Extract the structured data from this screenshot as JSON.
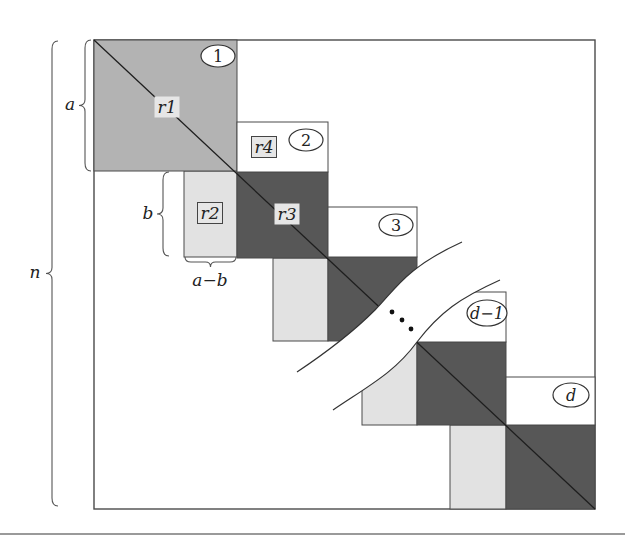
{
  "figure": {
    "colors": {
      "background": "#ffffff",
      "outline": "#4a4a4a",
      "block1_fill": "#b3b3b3",
      "dark_fill": "#575757",
      "light_fill": "#e2e2e2",
      "label_box_fill": "#e6e6e6",
      "diagonal": "#1e1e1e"
    },
    "outer_box": {
      "x": 94,
      "y": 40,
      "w": 501,
      "h": 469
    },
    "blocks": [
      {
        "id": "1",
        "label": "1",
        "white": null,
        "shade": {
          "x": 94,
          "y": 40,
          "w": 143,
          "h": 131,
          "kind": "block1"
        },
        "ellipse": {
          "cx": 218,
          "cy": 56,
          "rx": 17,
          "ry": 11
        }
      },
      {
        "id": "2",
        "label": "2",
        "white": {
          "x": 237,
          "y": 122,
          "w": 91,
          "h": 50
        },
        "shade": {
          "x": 237,
          "y": 172,
          "w": 91,
          "h": 86,
          "kind": "dark"
        },
        "ellipse": {
          "cx": 306,
          "cy": 140,
          "rx": 17,
          "ry": 11
        }
      },
      {
        "id": "3",
        "label": "3",
        "white": {
          "x": 328,
          "y": 207,
          "w": 89,
          "h": 50
        },
        "shade": {
          "x": 328,
          "y": 257,
          "w": 89,
          "h": 84,
          "kind": "dark"
        },
        "ellipse": {
          "cx": 396,
          "cy": 225,
          "rx": 17,
          "ry": 11
        }
      },
      {
        "id": "d-1",
        "label": "d−1",
        "white": {
          "x": 417,
          "y": 292,
          "w": 89,
          "h": 50
        },
        "shade": {
          "x": 417,
          "y": 342,
          "w": 89,
          "h": 83,
          "kind": "dark"
        },
        "ellipse": {
          "cx": 487,
          "cy": 313,
          "rx": 20,
          "ry": 13
        }
      },
      {
        "id": "d",
        "label": "d",
        "white": {
          "x": 506,
          "y": 377,
          "w": 89,
          "h": 48
        },
        "shade": {
          "x": 506,
          "y": 425,
          "w": 89,
          "h": 84,
          "kind": "dark"
        },
        "ellipse": {
          "cx": 571,
          "cy": 395,
          "rx": 18,
          "ry": 12
        }
      }
    ],
    "light_blocks": [
      {
        "x": 184,
        "y": 171,
        "w": 53,
        "h": 86
      },
      {
        "x": 273,
        "y": 258,
        "w": 55,
        "h": 83
      },
      {
        "x": 362,
        "y": 341,
        "w": 55,
        "h": 84
      },
      {
        "x": 450,
        "y": 425,
        "w": 56,
        "h": 84
      }
    ],
    "region_labels": [
      {
        "text": "r1",
        "x": 167,
        "y": 107,
        "boxed": false
      },
      {
        "text": "r4",
        "x": 264,
        "y": 147,
        "boxed": true
      },
      {
        "text": "r2",
        "x": 210,
        "y": 213,
        "boxed": true
      },
      {
        "text": "r3",
        "x": 287,
        "y": 214,
        "boxed": false
      }
    ],
    "tear": {
      "upper": "M 297 372 C 330 350, 355 330, 375 310 C 395 290, 405 268, 462 242",
      "lower": "M 333 410 C 370 385, 395 372, 417 342 C 440 312, 460 298, 500 280",
      "ellipsis_dots": [
        {
          "x": 392,
          "y": 312
        },
        {
          "x": 402,
          "y": 320
        },
        {
          "x": 411,
          "y": 329
        }
      ]
    },
    "braces": [
      {
        "id": "n",
        "label": "n",
        "orientation": "vertical",
        "x": 52,
        "y1": 41,
        "y2": 506,
        "label_x": 35,
        "label_y": 278
      },
      {
        "id": "a",
        "label": "a",
        "orientation": "vertical",
        "x": 85,
        "y1": 40,
        "y2": 171,
        "label_x": 70,
        "label_y": 110
      },
      {
        "id": "b",
        "label": "b",
        "orientation": "vertical",
        "x": 163,
        "y1": 172,
        "y2": 256,
        "label_x": 148,
        "label_y": 219
      },
      {
        "id": "a-b",
        "label": "a−b",
        "orientation": "horizontal",
        "y": 262,
        "x1": 185,
        "x2": 236,
        "label_x": 210,
        "label_y": 286
      }
    ]
  }
}
